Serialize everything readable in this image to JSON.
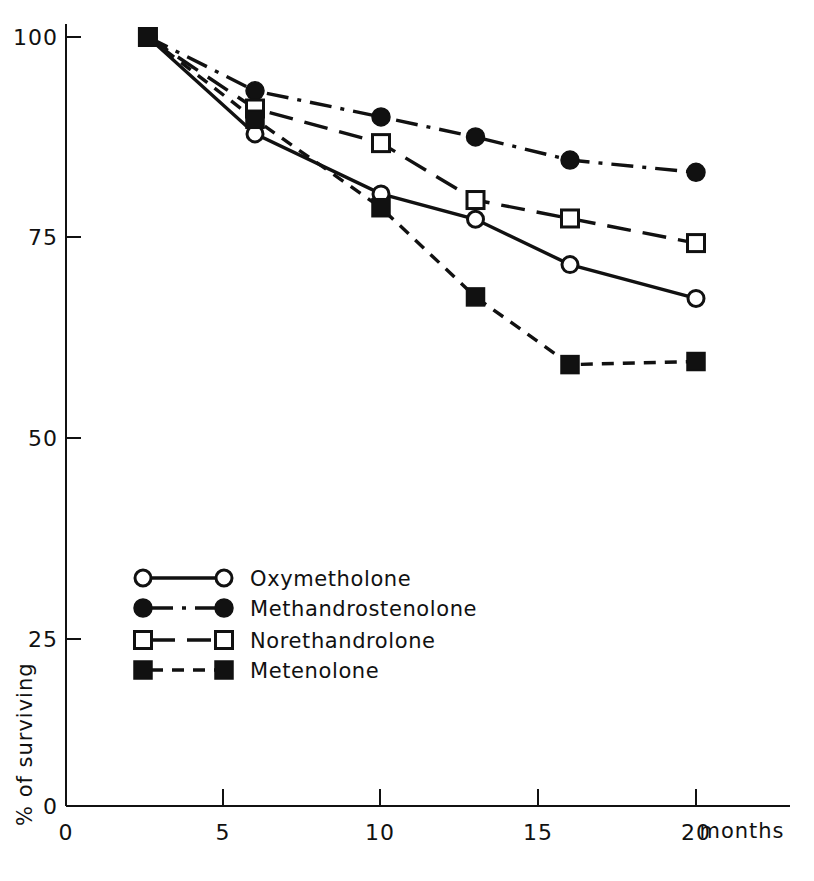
{
  "chart_data": {
    "type": "line",
    "title": "",
    "subtitle": "",
    "xlabel": "months",
    "ylabel": "% of surviving",
    "xlim": [
      0,
      22
    ],
    "ylim": [
      0,
      105
    ],
    "x_ticks": [
      0,
      5,
      10,
      15,
      20
    ],
    "x_tick_labels": [
      "0",
      "5",
      "10",
      "15",
      "20"
    ],
    "y_ticks": [
      0,
      25,
      50,
      75,
      100
    ],
    "y_tick_labels": [
      "0",
      "25",
      "50",
      "75",
      "100"
    ],
    "grid": false,
    "legend_position": "lower-left-inside",
    "series": [
      {
        "name": "Oxymetholone",
        "marker": "open-circle",
        "line_style": "solid",
        "x": [
          2.6,
          6.0,
          10.0,
          13.0,
          16.0,
          20.0
        ],
        "values": [
          100,
          87.4,
          79.6,
          76.3,
          70.4,
          66.0
        ]
      },
      {
        "name": "Methandrostenolone",
        "marker": "filled-circle",
        "line_style": "dash-dot",
        "x": [
          2.6,
          6.0,
          10.0,
          13.0,
          16.0,
          20.0
        ],
        "values": [
          100,
          93.0,
          89.6,
          87.0,
          84.0,
          82.4
        ]
      },
      {
        "name": "Norethandrolone",
        "marker": "open-square",
        "line_style": "long-dash",
        "x": [
          2.6,
          6.0,
          10.0,
          13.0,
          16.0,
          20.0
        ],
        "values": [
          100,
          90.7,
          86.2,
          78.8,
          76.4,
          73.2
        ]
      },
      {
        "name": "Metenolone",
        "marker": "filled-square",
        "line_style": "short-dash",
        "x": [
          2.6,
          6.0,
          10.0,
          13.0,
          16.0,
          20.0
        ],
        "values": [
          100,
          89.3,
          77.8,
          66.2,
          57.4,
          57.8
        ]
      }
    ]
  },
  "axes": {
    "y_label": "% of surviving",
    "x_unit_label": "months",
    "y_ticks": [
      "100",
      "75",
      "50",
      "25",
      "0"
    ],
    "x_ticks": [
      "0",
      "5",
      "10",
      "15",
      "20"
    ]
  },
  "legend": {
    "entries": [
      {
        "label": "Oxymetholone",
        "marker": "open-circle",
        "line_style": "solid"
      },
      {
        "label": "Methandrostenolone",
        "marker": "filled-circle",
        "line_style": "dash-dot"
      },
      {
        "label": "Norethandrolone",
        "marker": "open-square",
        "line_style": "long-dash"
      },
      {
        "label": "Metenolone",
        "marker": "filled-square",
        "line_style": "short-dash"
      }
    ]
  },
  "colors": {
    "ink": "#111111",
    "background": "#ffffff"
  }
}
